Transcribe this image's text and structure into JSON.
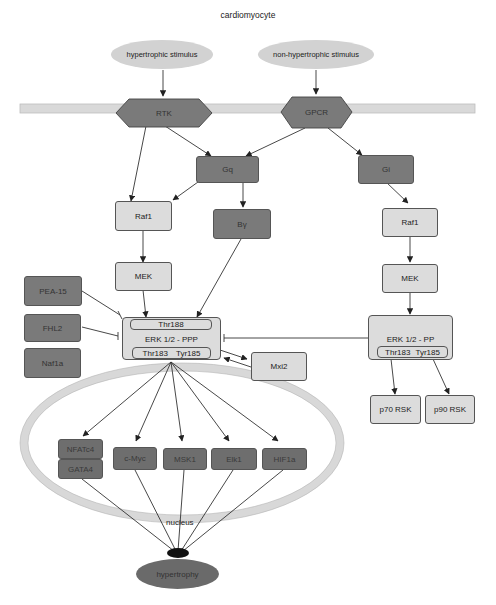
{
  "title": "cardiomyocyte",
  "colors": {
    "membrane": "#d9d9d9",
    "dark_node": "#7a7a7a",
    "light_node": "#dcdcdc",
    "stimulus": "#d2d2d2",
    "edge": "#333333"
  },
  "stimuli": {
    "hypertrophic": "hypertrophic stimulus",
    "non_hypertrophic": "non-hypertrophic stimulus"
  },
  "receptors": {
    "rtk": "RTK",
    "gpcr": "GPCR"
  },
  "left_pathway": {
    "gq": "Gq",
    "by": "Βγ",
    "raf1": "Raf1",
    "mek": "MEK",
    "erk": {
      "top_site": "Thr188",
      "label": "ERK 1/2 - PPP",
      "bottom_site_1": "Thr183",
      "bottom_site_2": "Tyr185"
    }
  },
  "inhibitors": {
    "pea15": "PEA-15",
    "fhl2": "FHL2",
    "naf1a": "Naf1a"
  },
  "mxi2": "Mxi2",
  "right_pathway": {
    "gi": "Gi",
    "raf1": "Raf1",
    "mek": "MEK",
    "erk": {
      "label": "ERK 1/2 - PP",
      "bottom_site_1": "Thr183",
      "bottom_site_2": "Tyr185"
    },
    "p70": "p70 RSK",
    "p90": "p90 RSK"
  },
  "nucleus": {
    "label": "nucleus",
    "factors": {
      "nfatc4": "NFATc4",
      "gata4": "GATA4",
      "cmyc": "c-Myc",
      "msk1": "MSK1",
      "elk1": "Elk1",
      "hif1a": "HIF1a"
    }
  },
  "outcome": "hypertrophy"
}
